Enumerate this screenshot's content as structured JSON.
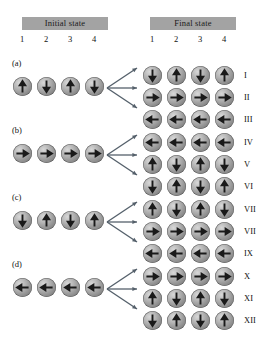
{
  "figure": {
    "headers": {
      "initial": "Initial state",
      "final": "Final state",
      "column_numbers": [
        "1",
        "2",
        "3",
        "4"
      ]
    },
    "legend": {
      "spin_up": "up",
      "spin_down": "down",
      "spin_right": "right",
      "spin_left": "left"
    },
    "colors": {
      "header_band": "#a3a3a3",
      "sphere_light": "#d8d8d8",
      "sphere_dark": "#6f6f6f",
      "arrow": "#1a1a1a",
      "branch_arrow": "#55606b",
      "background": "#ffffff"
    },
    "groups": [
      {
        "panel": "(a)",
        "initial": [
          "up",
          "down",
          "up",
          "down"
        ],
        "final": [
          {
            "numeral": "I",
            "spins": [
              "down",
              "up",
              "down",
              "up"
            ]
          },
          {
            "numeral": "II",
            "spins": [
              "right",
              "right",
              "right",
              "right"
            ]
          },
          {
            "numeral": "III",
            "spins": [
              "left",
              "left",
              "left",
              "left"
            ]
          }
        ]
      },
      {
        "panel": "(b)",
        "initial": [
          "right",
          "right",
          "right",
          "right"
        ],
        "final": [
          {
            "numeral": "IV",
            "spins": [
              "left",
              "left",
              "left",
              "left"
            ]
          },
          {
            "numeral": "V",
            "spins": [
              "up",
              "down",
              "up",
              "down"
            ]
          },
          {
            "numeral": "VI",
            "spins": [
              "down",
              "up",
              "down",
              "up"
            ]
          }
        ]
      },
      {
        "panel": "(c)",
        "initial": [
          "down",
          "up",
          "down",
          "up"
        ],
        "final": [
          {
            "numeral": "VII",
            "spins": [
              "up",
              "down",
              "up",
              "down"
            ]
          },
          {
            "numeral": "VII",
            "spins": [
              "right",
              "right",
              "right",
              "right"
            ]
          },
          {
            "numeral": "IX",
            "spins": [
              "left",
              "left",
              "left",
              "left"
            ]
          }
        ]
      },
      {
        "panel": "(d)",
        "initial": [
          "left",
          "left",
          "left",
          "left"
        ],
        "final": [
          {
            "numeral": "X",
            "spins": [
              "right",
              "right",
              "right",
              "right"
            ]
          },
          {
            "numeral": "XI",
            "spins": [
              "up",
              "down",
              "up",
              "down"
            ]
          },
          {
            "numeral": "XII",
            "spins": [
              "down",
              "up",
              "down",
              "up"
            ]
          }
        ]
      }
    ]
  }
}
